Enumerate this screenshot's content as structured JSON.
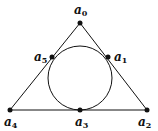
{
  "diagram": {
    "type": "triangle-with-incircle",
    "stroke_color": "#111111",
    "background": "#ffffff",
    "triangle": {
      "vertices": [
        "a0",
        "a2",
        "a4"
      ]
    },
    "circle": {
      "cx": 80,
      "cy": 78,
      "r": 32
    },
    "points": [
      {
        "id": "a0",
        "base": "a",
        "sub": "0",
        "x": 80,
        "y": 23,
        "lx": 74,
        "ly": 14
      },
      {
        "id": "a1",
        "base": "a",
        "sub": "1",
        "x": 108,
        "y": 57,
        "lx": 114,
        "ly": 61
      },
      {
        "id": "a2",
        "base": "a",
        "sub": "2",
        "x": 147,
        "y": 110,
        "lx": 138,
        "ly": 126
      },
      {
        "id": "a3",
        "base": "a",
        "sub": "3",
        "x": 80,
        "y": 110,
        "lx": 75,
        "ly": 126
      },
      {
        "id": "a4",
        "base": "a",
        "sub": "4",
        "x": 10,
        "y": 110,
        "lx": 4,
        "ly": 126
      },
      {
        "id": "a5",
        "base": "a",
        "sub": "5",
        "x": 52,
        "y": 57,
        "lx": 34,
        "ly": 61
      }
    ]
  }
}
